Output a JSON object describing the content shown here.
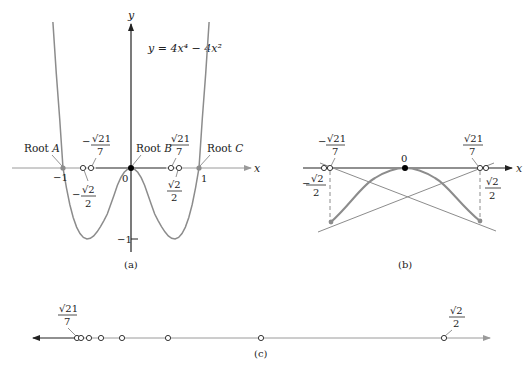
{
  "figure": {
    "function_label": "y = 4x⁴ − 4x²",
    "colors": {
      "curve": "#8c8c8c",
      "axis": "#222222",
      "axis_light": "#9a9a9a",
      "root_dot": "#8c8c8c",
      "origin_dot": "#000000"
    }
  },
  "panel_a": {
    "caption": "(a)",
    "x_axis_label": "x",
    "y_axis_label": "y",
    "ticks": {
      "neg_one_x": "−1",
      "zero": "0",
      "one_x": "1",
      "neg_one_y": "−1"
    },
    "roots": [
      {
        "label": "Root",
        "letter": "A",
        "x": -1
      },
      {
        "label": "Root",
        "letter": "B",
        "x": 0
      },
      {
        "label": "Root",
        "letter": "C",
        "x": 1
      }
    ],
    "markers": {
      "neg_sqrt21_7": {
        "sign": "−",
        "num": "√21",
        "den": "7"
      },
      "neg_sqrt2_2": {
        "sign": "−",
        "num": "√2",
        "den": "2"
      },
      "sqrt21_7": {
        "num": "√21",
        "den": "7"
      },
      "sqrt2_2": {
        "num": "√2",
        "den": "2"
      }
    }
  },
  "panel_b": {
    "caption": "(b)",
    "x_axis_label": "x",
    "center_label": "0",
    "markers": {
      "neg_sqrt21_7": {
        "sign": "−",
        "num": "√21",
        "den": "7"
      },
      "neg_sqrt2_2": {
        "sign": "−",
        "num": "√2",
        "den": "2"
      },
      "sqrt21_7": {
        "num": "√21",
        "den": "7"
      },
      "sqrt2_2": {
        "num": "√2",
        "den": "2"
      }
    }
  },
  "panel_c": {
    "caption": "(c)",
    "left_marker": {
      "num": "√21",
      "den": "7"
    },
    "right_marker": {
      "num": "√2",
      "den": "2"
    },
    "iterate_count": 8
  }
}
